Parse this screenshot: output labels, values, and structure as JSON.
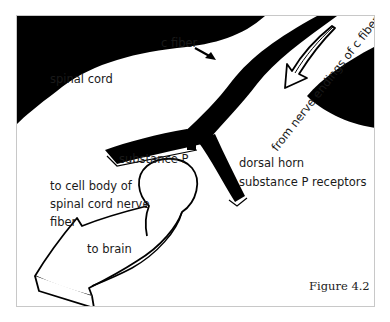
{
  "diagram": {
    "labels": {
      "c_fiber": "c fiber",
      "from_nerve_endings": "from nerve endings of c fiber",
      "spinal_cord": "spinal cord",
      "substance_p": "substance P",
      "dorsal_horn": "dorsal horn",
      "substance_p_receptors": "substance P receptors",
      "to_cell_body_line1": "to cell body of",
      "to_cell_body_line2": "spinal cord nerve",
      "to_cell_body_line3": "fiber",
      "to_brain": "to brain"
    },
    "caption": "Figure 4.2",
    "colors": {
      "ink": "#000000",
      "paper": "#ffffff",
      "frame": "#c8c8c8"
    }
  }
}
